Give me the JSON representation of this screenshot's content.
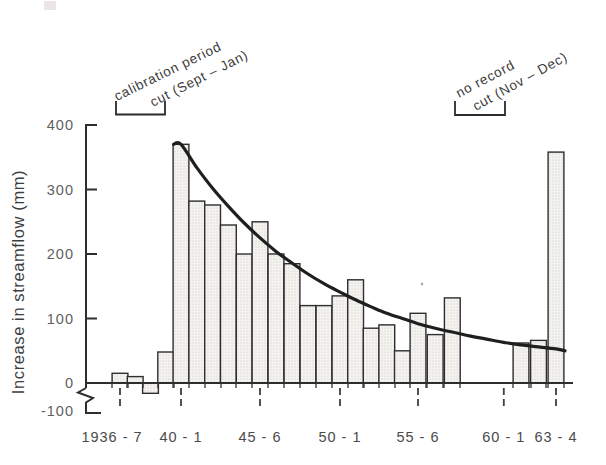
{
  "figure": {
    "ylabel": "Increase in streamflow (mm)",
    "annotations": {
      "calibration_line1": "calibration period",
      "calibration_line2": "cut (Sept – Jan)",
      "no_record_line1": "no record",
      "no_record_line2": "cut (Nov – Dec)"
    },
    "colors": {
      "ink": "#2e2e2e",
      "curve": "#1f1f1f",
      "bar_fill": "#f4f3ef",
      "bar_stipple": "#c7c6c0",
      "background": "#ffffff"
    }
  },
  "chart_data": {
    "type": "bar",
    "title": "",
    "xlabel": "",
    "ylabel": "Increase in streamflow (mm)",
    "ylim": [
      -100,
      400
    ],
    "y_axis_break_below_zero": true,
    "grid": false,
    "yticks": [
      400,
      300,
      200,
      100,
      0,
      -100
    ],
    "categories": [
      "1936-7",
      "1937-8",
      "1938-9",
      "1939-40",
      "1940-1",
      "1941-2",
      "1942-3",
      "1943-4",
      "1944-5",
      "1945-6",
      "1946-7",
      "1947-8",
      "1948-9",
      "1949-50",
      "1950-1",
      "1951-2",
      "1952-3",
      "1953-4",
      "1954-5",
      "1955-6",
      "1956-7",
      "1957-8",
      "1958-9",
      "1959-60",
      "1960-1",
      "1961-2",
      "1962-3",
      "1963-4"
    ],
    "values": [
      15,
      10,
      -16,
      48,
      370,
      282,
      276,
      245,
      200,
      250,
      200,
      185,
      120,
      120,
      135,
      160,
      85,
      90,
      50,
      108,
      75,
      132,
      null,
      null,
      null,
      62,
      66,
      358
    ],
    "no_record_years": [
      "1958-9",
      "1959-60",
      "1960-1"
    ],
    "xtick_labels": [
      "1936 - 7",
      "40 - 1",
      "45 - 6",
      "50 - 1",
      "55 - 6",
      "60 - 1",
      "63 - 4"
    ],
    "xtick_indices": [
      0,
      4,
      9,
      14,
      19,
      24,
      27
    ],
    "curve": {
      "name": "recession curve",
      "start_index": 4,
      "values": [
        370,
        334,
        302,
        274,
        248,
        225,
        204,
        186,
        169,
        154,
        141,
        129,
        118,
        108,
        100,
        92,
        85,
        79,
        73,
        68,
        63,
        59,
        56,
        53
      ]
    }
  }
}
